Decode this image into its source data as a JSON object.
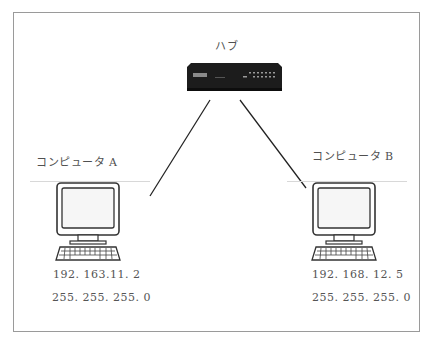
{
  "diagram": {
    "hub": {
      "label": "ハブ",
      "brand_mark": "BUFFALO"
    },
    "computers": [
      {
        "label": "コンピュータ A",
        "ip": "192. 163.11. 2",
        "subnet": "255. 255. 255. 0"
      },
      {
        "label": "コンピュータ B",
        "ip": "192. 168. 12. 5",
        "subnet": "255. 255. 255. 0"
      }
    ],
    "connections": [
      {
        "from": "hub",
        "to": "コンピュータ A"
      },
      {
        "from": "hub",
        "to": "コンピュータ B"
      }
    ],
    "colors": {
      "frame": "#9a9a9a",
      "hub_body": "#1c1c1c",
      "line": "#222222",
      "text": "#505050"
    }
  }
}
